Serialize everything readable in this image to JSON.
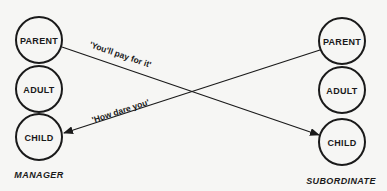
{
  "diagram": {
    "type": "crossed-transaction",
    "left_party": {
      "caption": "MANAGER",
      "states": [
        {
          "label": "PARENT"
        },
        {
          "label": "ADULT"
        },
        {
          "label": "CHILD"
        }
      ]
    },
    "right_party": {
      "caption": "SUBORDINATE",
      "states": [
        {
          "label": "PARENT"
        },
        {
          "label": "ADULT"
        },
        {
          "label": "CHILD"
        }
      ]
    },
    "transactions": [
      {
        "from": "MANAGER.PARENT",
        "to": "SUBORDINATE.CHILD",
        "message": "'You'll pay for it'"
      },
      {
        "from": "SUBORDINATE.PARENT",
        "to": "MANAGER.CHILD",
        "message": "'How dare you'"
      }
    ],
    "colors": {
      "ink": "#1a1a1a",
      "background": "#f6f6f4"
    }
  }
}
